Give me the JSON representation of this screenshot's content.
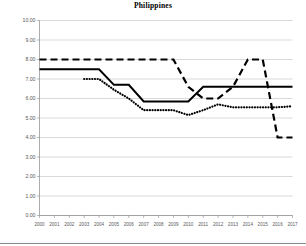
{
  "chart_data": {
    "type": "line",
    "title": "Philippines",
    "xlabel": "",
    "ylabel": "",
    "xlim": [
      2000,
      2017
    ],
    "ylim": [
      0,
      10
    ],
    "ytick_step": 1,
    "grid": true,
    "legend": "none",
    "x": [
      2000,
      2001,
      2002,
      2003,
      2004,
      2005,
      2006,
      2007,
      2008,
      2009,
      2010,
      2011,
      2012,
      2013,
      2014,
      2015,
      2016,
      2017
    ],
    "categories": [
      "2000",
      "2001",
      "2002",
      "2003",
      "2004",
      "2005",
      "2006",
      "2007",
      "2008",
      "2009",
      "2010",
      "2011",
      "2012",
      "2013",
      "2014",
      "2015",
      "2016",
      "2017"
    ],
    "ytick_labels": [
      "0.00",
      "1.00",
      "2.00",
      "3.00",
      "4.00",
      "5.00",
      "6.00",
      "7.00",
      "8.00",
      "9.00",
      "10.00"
    ],
    "series": [
      {
        "name": "dashed-series",
        "style": "dashed",
        "color": "#000000",
        "values": [
          8.0,
          8.0,
          8.0,
          8.0,
          8.0,
          8.0,
          8.0,
          8.0,
          8.0,
          8.0,
          6.6,
          6.0,
          6.0,
          6.6,
          8.0,
          8.0,
          4.0,
          4.0
        ]
      },
      {
        "name": "solid-series",
        "style": "solid",
        "color": "#000000",
        "values": [
          7.5,
          7.5,
          7.5,
          7.5,
          7.5,
          6.7,
          6.7,
          5.85,
          5.85,
          5.85,
          5.85,
          6.6,
          6.6,
          6.6,
          6.6,
          6.6,
          6.6,
          6.6
        ]
      },
      {
        "name": "dotted-series",
        "style": "dotted",
        "color": "#000000",
        "values": [
          null,
          null,
          null,
          7.0,
          7.0,
          6.45,
          6.0,
          5.4,
          5.4,
          5.4,
          5.15,
          5.4,
          5.7,
          5.55,
          5.55,
          5.55,
          5.55,
          5.6
        ]
      }
    ]
  }
}
